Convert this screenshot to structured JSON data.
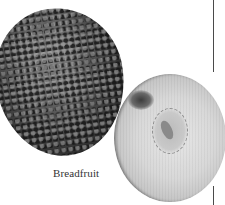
{
  "image": {
    "subject": "breadfruit photograph (whole fruit and cut half)",
    "caption": "Breadfruit"
  }
}
